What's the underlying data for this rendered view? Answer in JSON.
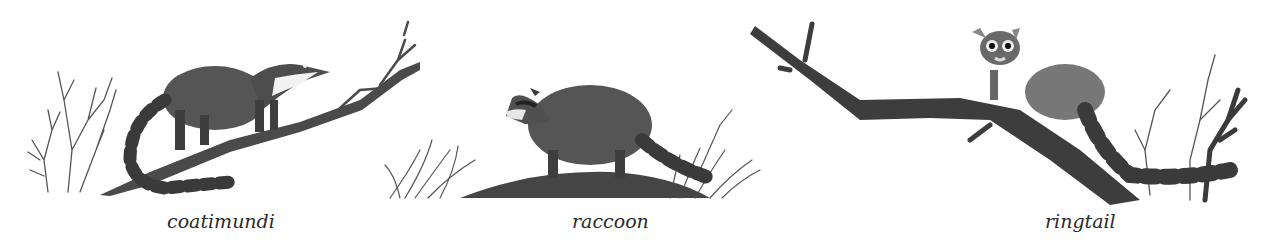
{
  "illustration": {
    "style": "pencil/graphite wildlife illustration",
    "colors": {
      "background": "#ffffff",
      "ink": "#2a2a2a",
      "fur_dark": "#3a3a3a",
      "fur_mid": "#6e6e6e",
      "branch": "#444444"
    },
    "panels": [
      {
        "id": "coatimundi",
        "caption": "coatimundi",
        "scene": "coatimundi standing on a diagonal branch, ringed tail hanging below, bare twigs at left"
      },
      {
        "id": "raccoon",
        "caption": "raccoon",
        "scene": "raccoon walking on a fallen log among grass tufts"
      },
      {
        "id": "ringtail",
        "caption": "ringtail",
        "scene": "ringtail perched on a long branch with banded bushy tail, bare twigs at right"
      }
    ]
  }
}
